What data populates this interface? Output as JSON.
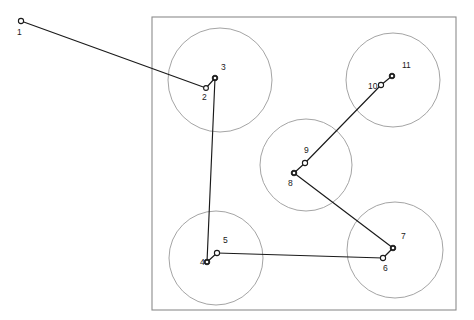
{
  "figure": {
    "type": "tour-route-diagram",
    "title": "",
    "canvas": {
      "width": 474,
      "height": 320,
      "background": "#ffffff"
    },
    "colors": {
      "boundary_stroke": "#8c8c8c",
      "circle_stroke": "#9a9a9a",
      "route_stroke": "#1a1a1a",
      "node_fill": "#ffffff",
      "node_stroke": "#1a1a1a",
      "label_color": "#1a1a1a"
    },
    "boundary_rect": {
      "x": 152,
      "y": 17,
      "width": 304,
      "height": 293
    },
    "circles": [
      {
        "name": "circle-top-left",
        "cx": 220,
        "cy": 80,
        "r": 52
      },
      {
        "name": "circle-top-right",
        "cx": 393,
        "cy": 80,
        "r": 47
      },
      {
        "name": "circle-center",
        "cx": 306,
        "cy": 165,
        "r": 46
      },
      {
        "name": "circle-bottom-left",
        "cx": 216,
        "cy": 258,
        "r": 47
      },
      {
        "name": "circle-bottom-right",
        "cx": 395,
        "cy": 250,
        "r": 48
      }
    ],
    "nodes": [
      {
        "id": "1",
        "x": 21,
        "y": 21,
        "label": "1",
        "lx": 17,
        "ly": 33,
        "r": 2.6,
        "filled": false
      },
      {
        "id": "2",
        "x": 206,
        "y": 88,
        "label": "2",
        "lx": 202,
        "ly": 98,
        "r": 2.4,
        "filled": false
      },
      {
        "id": "3",
        "x": 215,
        "y": 78,
        "label": "3",
        "lx": 221,
        "ly": 68,
        "r": 2.8,
        "filled": true
      },
      {
        "id": "4",
        "x": 207,
        "y": 262,
        "label": "4",
        "lx": 200,
        "ly": 263,
        "r": 2.8,
        "filled": true
      },
      {
        "id": "5",
        "x": 217,
        "y": 253,
        "label": "5",
        "lx": 223,
        "ly": 241,
        "r": 2.6,
        "filled": false
      },
      {
        "id": "6",
        "x": 383,
        "y": 258,
        "label": "6",
        "lx": 383,
        "ly": 269,
        "r": 2.6,
        "filled": false
      },
      {
        "id": "7",
        "x": 393,
        "y": 248,
        "label": "7",
        "lx": 401,
        "ly": 237,
        "r": 2.8,
        "filled": true
      },
      {
        "id": "8",
        "x": 294,
        "y": 173,
        "label": "8",
        "lx": 288,
        "ly": 184,
        "r": 2.8,
        "filled": true
      },
      {
        "id": "9",
        "x": 305,
        "y": 163,
        "label": "9",
        "lx": 304,
        "ly": 151,
        "r": 2.6,
        "filled": false
      },
      {
        "id": "10",
        "x": 381,
        "y": 85,
        "label": "10",
        "lx": 368,
        "ly": 87,
        "r": 2.6,
        "filled": false
      },
      {
        "id": "11",
        "x": 392,
        "y": 76,
        "label": "11",
        "lx": 402,
        "ly": 66,
        "r": 2.8,
        "filled": true
      }
    ],
    "route_order": [
      "1",
      "2",
      "3",
      "4",
      "5",
      "6",
      "7",
      "8",
      "9",
      "10",
      "11"
    ],
    "edges": [
      {
        "from": "1",
        "to": "2"
      },
      {
        "from": "2",
        "to": "3"
      },
      {
        "from": "3",
        "to": "4"
      },
      {
        "from": "4",
        "to": "5"
      },
      {
        "from": "5",
        "to": "6"
      },
      {
        "from": "6",
        "to": "7"
      },
      {
        "from": "7",
        "to": "8"
      },
      {
        "from": "8",
        "to": "9"
      },
      {
        "from": "9",
        "to": "10"
      },
      {
        "from": "10",
        "to": "11"
      }
    ]
  },
  "chart_data": {
    "type": "scatter",
    "title": "",
    "xlabel": "",
    "ylabel": "",
    "xlim": [
      0,
      474
    ],
    "ylim": [
      0,
      320
    ],
    "grid": false,
    "legend": null,
    "annotations": [
      "1",
      "2",
      "3",
      "4",
      "5",
      "6",
      "7",
      "8",
      "9",
      "10",
      "11"
    ],
    "x": [
      21,
      206,
      215,
      207,
      217,
      383,
      393,
      294,
      305,
      381,
      392
    ],
    "y": [
      21,
      88,
      78,
      262,
      253,
      258,
      248,
      173,
      163,
      85,
      76
    ],
    "series": [
      {
        "name": "route",
        "points": [
          [
            21,
            21
          ],
          [
            206,
            88
          ],
          [
            215,
            78
          ],
          [
            207,
            262
          ],
          [
            217,
            253
          ],
          [
            383,
            258
          ],
          [
            393,
            248
          ],
          [
            294,
            173
          ],
          [
            305,
            163
          ],
          [
            381,
            85
          ],
          [
            392,
            76
          ]
        ]
      }
    ]
  }
}
